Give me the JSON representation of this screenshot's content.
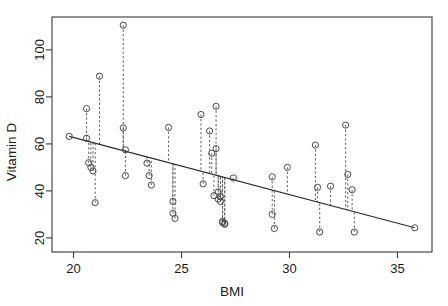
{
  "chart_data": {
    "type": "scatter",
    "title": "",
    "subtitle": "",
    "xlabel": "BMI",
    "ylabel": "Vitamin D",
    "xlim": [
      19.0,
      36.6
    ],
    "ylim": [
      14.0,
      114.0
    ],
    "xticks": [
      20,
      25,
      30,
      35
    ],
    "yticks": [
      20,
      40,
      60,
      80,
      100
    ],
    "xticklabels": [
      "20",
      "25",
      "30",
      "35"
    ],
    "yticklabels": [
      "20",
      "40",
      "60",
      "80",
      "100"
    ],
    "grid": false,
    "legend": null,
    "annotations": [],
    "point_marker": "open-circle",
    "residuals_shown": true,
    "residual_style": "dashed",
    "fit_line": {
      "type": "linear-regression",
      "x_start": 19.8,
      "y_start": 63.2,
      "x_end": 35.8,
      "y_end": 24.3,
      "slope": -2.43,
      "intercept": 111.3
    },
    "x": [
      19.8,
      20.6,
      20.6,
      20.7,
      20.8,
      20.9,
      21.0,
      21.2,
      22.3,
      22.3,
      22.4,
      22.4,
      23.4,
      23.5,
      23.6,
      24.4,
      24.6,
      24.6,
      24.7,
      25.9,
      26.0,
      26.3,
      26.4,
      26.5,
      26.6,
      26.6,
      26.7,
      26.7,
      26.8,
      26.8,
      26.9,
      26.9,
      27.0,
      27.0,
      27.4,
      29.2,
      29.2,
      29.3,
      29.9,
      31.2,
      31.3,
      31.4,
      31.9,
      32.6,
      32.7,
      32.9,
      33.0,
      35.8
    ],
    "y": [
      63.2,
      75.0,
      62.4,
      52.0,
      50.0,
      48.5,
      35.0,
      88.8,
      110.5,
      66.8,
      57.5,
      46.5,
      51.8,
      46.5,
      42.5,
      67.0,
      30.5,
      35.5,
      28.3,
      72.5,
      43.0,
      65.5,
      56.0,
      38.0,
      76.0,
      58.0,
      39.5,
      36.5,
      37.5,
      35.5,
      27.0,
      26.5,
      26.2,
      25.8,
      45.5,
      46.0,
      30.0,
      24.0,
      50.0,
      59.5,
      41.5,
      22.5,
      42.0,
      68.0,
      47.0,
      40.5,
      22.5,
      24.3
    ]
  },
  "axes": {
    "x_label": "BMI",
    "y_label": "Vitamin D"
  }
}
